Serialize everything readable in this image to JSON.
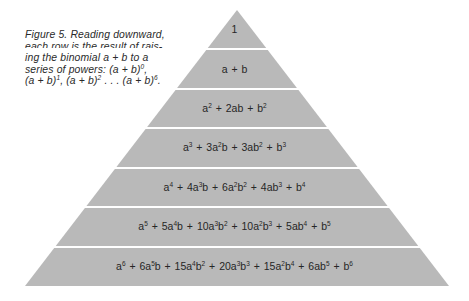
{
  "caption": {
    "lines": [
      "Figure 5. Reading downward,",
      "each row is the result of rais-",
      "ing the binomial a + b to a",
      "series of powers: (a + b)⁰,",
      "(a + b)¹, (a + b)² . . . (a + b)⁶."
    ]
  },
  "colors": {
    "fill": "#b9b9b9",
    "separator": "#ffffff",
    "text": "#262626"
  },
  "pyramid": {
    "apex": [
      237,
      10
    ],
    "base_left": [
      25,
      286
    ],
    "base_right": [
      449,
      286
    ],
    "separators_y": [
      49,
      89,
      128,
      168,
      207,
      247
    ],
    "rows": [
      {
        "power": 0,
        "expansion": "1"
      },
      {
        "power": 1,
        "expansion": "a + b"
      },
      {
        "power": 2,
        "expansion": "a² + 2ab + b²"
      },
      {
        "power": 3,
        "expansion": "a³ + 3a²b + 3ab² + b³"
      },
      {
        "power": 4,
        "expansion": "a⁴ + 4a³b + 6a²b² + 4ab³ + b⁴"
      },
      {
        "power": 5,
        "expansion": "a⁵ + 5a⁴b + 10a³b² + 10a²b³ + 5ab⁴ + b⁵"
      },
      {
        "power": 6,
        "expansion": "a⁶ + 6a⁵b + 15a⁴b² + 20a³b³ + 15a²b⁴ + 6ab⁵ + b⁶"
      }
    ]
  }
}
